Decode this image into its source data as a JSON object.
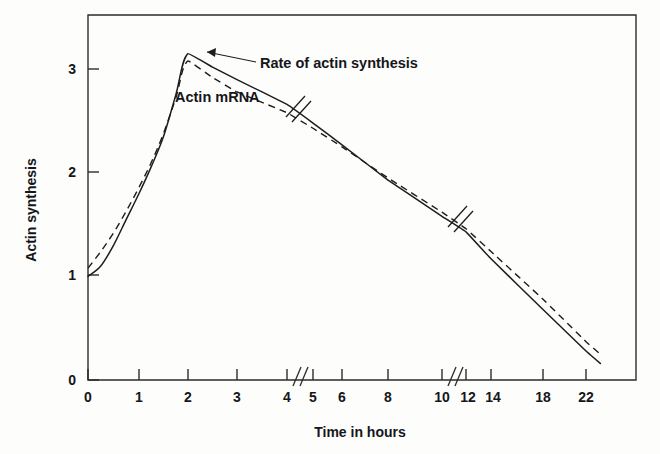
{
  "chart_data": {
    "type": "line",
    "title": "",
    "xlabel": "Time in hours",
    "ylabel": "Actin synthesis",
    "grid": false,
    "legend_position": "inline-annotations",
    "x_axis": {
      "tick_labels": [
        "0",
        "1",
        "2",
        "3",
        "4",
        "5",
        "6",
        "8",
        "10",
        "12",
        "14",
        "18",
        "22"
      ],
      "tick_values": [
        0,
        1,
        2,
        3,
        4,
        5,
        6,
        8,
        10,
        12,
        14,
        18,
        22
      ],
      "breaks": [
        "between 4 and 5",
        "between 10 and 12"
      ],
      "note": "axis is piecewise-compressed: 0-4 at one scale, 5-10 at a second, 12-22 at a third"
    },
    "y_axis": {
      "tick_labels": [
        "0",
        "1",
        "2",
        "3"
      ],
      "tick_values": [
        0,
        1,
        2,
        3
      ],
      "ylim": [
        0,
        3.45
      ]
    },
    "series": [
      {
        "name": "Rate of actin synthesis",
        "style": "solid",
        "label_text": "Rate of actin synthesis",
        "has_break_marks": true,
        "points": [
          {
            "x": 0,
            "y": 1.0
          },
          {
            "x": 0.25,
            "y": 1.1
          },
          {
            "x": 0.5,
            "y": 1.3
          },
          {
            "x": 0.75,
            "y": 1.55
          },
          {
            "x": 1.0,
            "y": 1.8
          },
          {
            "x": 1.25,
            "y": 2.06
          },
          {
            "x": 1.5,
            "y": 2.35
          },
          {
            "x": 1.75,
            "y": 2.75
          },
          {
            "x": 2.0,
            "y": 3.15
          },
          {
            "x": 2.5,
            "y": 3.02
          },
          {
            "x": 3.0,
            "y": 2.9
          },
          {
            "x": 4.0,
            "y": 2.66
          },
          {
            "x": 5.0,
            "y": 2.48
          },
          {
            "x": 6.0,
            "y": 2.27
          },
          {
            "x": 8.0,
            "y": 1.93
          },
          {
            "x": 10.0,
            "y": 1.58
          },
          {
            "x": 12.0,
            "y": 1.43
          },
          {
            "x": 14.0,
            "y": 1.17
          },
          {
            "x": 18.0,
            "y": 0.68
          },
          {
            "x": 22.0,
            "y": 0.28
          },
          {
            "x": 23.3,
            "y": 0.16
          }
        ]
      },
      {
        "name": "Actin mRNA",
        "style": "dashed",
        "label_text": "Actin mRNA",
        "has_break_marks": false,
        "points": [
          {
            "x": 0,
            "y": 1.08
          },
          {
            "x": 0.25,
            "y": 1.24
          },
          {
            "x": 0.5,
            "y": 1.42
          },
          {
            "x": 0.75,
            "y": 1.63
          },
          {
            "x": 1.0,
            "y": 1.86
          },
          {
            "x": 1.25,
            "y": 2.1
          },
          {
            "x": 1.5,
            "y": 2.38
          },
          {
            "x": 1.75,
            "y": 2.72
          },
          {
            "x": 2.0,
            "y": 3.08
          },
          {
            "x": 2.5,
            "y": 2.92
          },
          {
            "x": 3.0,
            "y": 2.78
          },
          {
            "x": 4.0,
            "y": 2.58
          },
          {
            "x": 5.0,
            "y": 2.43
          },
          {
            "x": 6.0,
            "y": 2.25
          },
          {
            "x": 8.0,
            "y": 1.95
          },
          {
            "x": 10.0,
            "y": 1.62
          },
          {
            "x": 12.0,
            "y": 1.46
          },
          {
            "x": 14.0,
            "y": 1.24
          },
          {
            "x": 18.0,
            "y": 0.78
          },
          {
            "x": 22.0,
            "y": 0.37
          },
          {
            "x": 23.3,
            "y": 0.25
          }
        ]
      }
    ],
    "annotations": [
      {
        "text": "Rate of actin synthesis",
        "points_to_series": "Rate of actin synthesis"
      },
      {
        "text": "Actin mRNA",
        "points_to_series": "Actin mRNA"
      }
    ]
  },
  "axis": {
    "y_title": "Actin synthesis",
    "x_title": "Time in hours",
    "y_ticks": [
      "3",
      "2",
      "1",
      "0"
    ],
    "x_ticks": [
      "0",
      "1",
      "2",
      "3",
      "4",
      "5",
      "6",
      "8",
      "10",
      "12",
      "14",
      "18",
      "22"
    ]
  },
  "labels": {
    "solid_curve": "Rate of actin synthesis",
    "dashed_curve": "Actin mRNA"
  },
  "colors": {
    "ink": "#1d1d1d",
    "frame": "#2b2b2b",
    "background": "#fdfdfc"
  }
}
